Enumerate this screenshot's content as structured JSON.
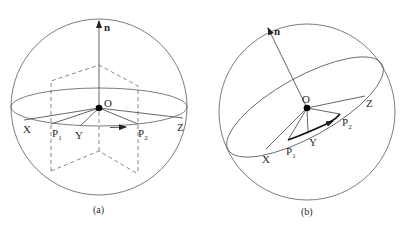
{
  "figure": {
    "panels": [
      {
        "id": "a",
        "caption": "(a)",
        "normal_label": "n",
        "center_label": "O",
        "points": {
          "X": "X",
          "P1": "P",
          "P1_sub": "1",
          "Y": "Y",
          "P2": "P",
          "P2_sub": "2",
          "Z": "Z"
        },
        "description": "Sphere with horizontal great circle, vertical normal n, dashed perpendicular plane through P1 and P2"
      },
      {
        "id": "b",
        "caption": "(b)",
        "normal_label": "n",
        "center_label": "O",
        "points": {
          "X": "X",
          "P1": "P",
          "P1_sub": "1",
          "Y": "Y",
          "P2": "P",
          "P2_sub": "2",
          "Z": "Z"
        },
        "description": "Sphere with tilted great circle, tilted normal n, bold arc from P1 to P2"
      }
    ],
    "colors": {
      "stroke": "#555555",
      "text": "#2a2a2a",
      "background": "#ffffff"
    }
  }
}
